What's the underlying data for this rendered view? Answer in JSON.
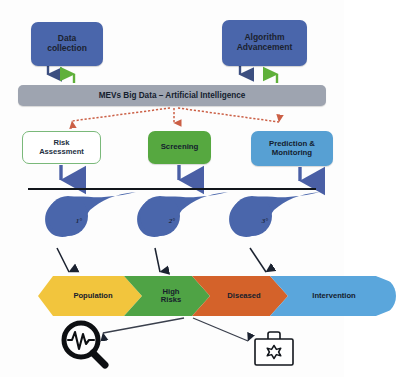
{
  "diagram": {
    "inputs": [
      {
        "id": "data-collection",
        "label": "Data\ncollection",
        "color": "#4a66ab"
      },
      {
        "id": "algorithm-advancement",
        "label": "Algorithm\nAdvancement",
        "color": "#4a66ab"
      }
    ],
    "banner": {
      "label": "MEVs Big Data – Artificial Intelligence",
      "color": "#9ea4b0"
    },
    "applications": [
      {
        "id": "risk-assessment",
        "label": "Risk\nAssessment",
        "color": "#ffffff",
        "border": "#7ab97a"
      },
      {
        "id": "screening",
        "label": "Screening",
        "color": "#56a840"
      },
      {
        "id": "prediction-monitoring",
        "label": "Prediction &\nMonitoring",
        "color": "#57a0d3"
      }
    ],
    "prevention_levels": [
      {
        "id": "primary",
        "label": "1°",
        "color": "#4a66ab"
      },
      {
        "id": "secondary",
        "label": "2°",
        "color": "#4a66ab"
      },
      {
        "id": "tertiary",
        "label": "3°",
        "color": "#4a66ab"
      }
    ],
    "population_stages": [
      {
        "id": "population",
        "label": "Population",
        "color": "#f2c53d"
      },
      {
        "id": "high-risks",
        "label": "High\nRisks",
        "color": "#4fa345"
      },
      {
        "id": "diseased",
        "label": "Diseased",
        "color": "#d4622a"
      },
      {
        "id": "intervention",
        "label": "Intervention",
        "color": "#5aa6dc"
      }
    ],
    "outcome_icons": [
      {
        "id": "diagnosis-magnifier-icon",
        "name": "magnifier-heartbeat-icon"
      },
      {
        "id": "medical-kit-icon",
        "name": "medical-briefcase-icon"
      }
    ],
    "arrow_colors": {
      "down_blue": "#3c4f80",
      "up_green": "#5fb03a",
      "dotted_red": "#d4694f",
      "thick_blue": "#4a5fa5",
      "black": "#1b2230"
    }
  }
}
